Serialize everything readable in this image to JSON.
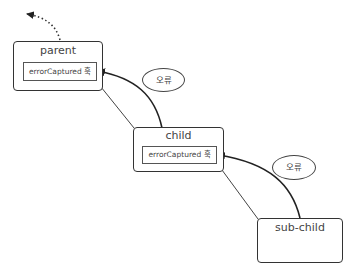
{
  "diagram": {
    "nodes": {
      "parent": {
        "label": "parent",
        "hook_label": "errorCaptured 훅"
      },
      "child": {
        "label": "child",
        "hook_label": "errorCaptured 훅"
      },
      "sub_child": {
        "label": "sub-child"
      }
    },
    "bubbles": [
      {
        "label": "오류"
      },
      {
        "label": "오류"
      }
    ],
    "edges": [
      {
        "from": "parent",
        "to": "child",
        "style": "solid-thin"
      },
      {
        "from": "child",
        "to": "sub-child",
        "style": "solid-thin"
      },
      {
        "from": "child",
        "to": "parent.hook",
        "style": "arrow",
        "meaning": "error propagation"
      },
      {
        "from": "sub-child",
        "to": "child.hook",
        "style": "arrow",
        "meaning": "error propagation"
      },
      {
        "from": "parent",
        "to": "upward",
        "style": "dotted-arrow"
      }
    ],
    "colors": {
      "stroke": "#333333",
      "background": "#ffffff"
    }
  }
}
